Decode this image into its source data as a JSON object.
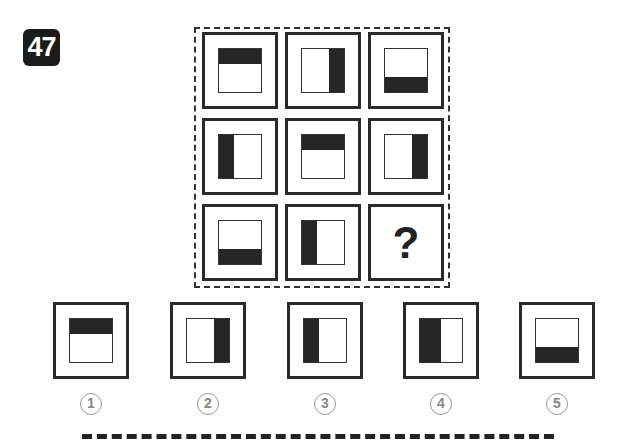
{
  "puzzle": {
    "number": "47",
    "grid": [
      {
        "row": 1,
        "col": 1,
        "shade": "top"
      },
      {
        "row": 1,
        "col": 2,
        "shade": "right"
      },
      {
        "row": 1,
        "col": 3,
        "shade": "bottom"
      },
      {
        "row": 2,
        "col": 1,
        "shade": "left"
      },
      {
        "row": 2,
        "col": 2,
        "shade": "top"
      },
      {
        "row": 2,
        "col": 3,
        "shade": "right"
      },
      {
        "row": 3,
        "col": 1,
        "shade": "bottom"
      },
      {
        "row": 3,
        "col": 2,
        "shade": "left"
      },
      {
        "row": 3,
        "col": 3,
        "shade": "unknown"
      }
    ],
    "question_mark": "?",
    "options": [
      {
        "label": "1",
        "shade": "top"
      },
      {
        "label": "2",
        "shade": "right"
      },
      {
        "label": "3",
        "shade": "left"
      },
      {
        "label": "4",
        "shade": "left-wide"
      },
      {
        "label": "5",
        "shade": "bottom"
      }
    ]
  },
  "colors": {
    "fill": "#262626",
    "border": "#2a2a2a",
    "option_number": "#888888"
  }
}
